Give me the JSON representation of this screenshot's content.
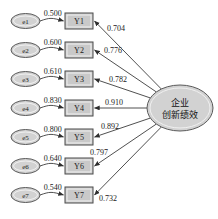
{
  "diagram": {
    "type": "sem-path-diagram",
    "title": "",
    "colors": {
      "node_fill": "#d2d2d2",
      "box_fill": "#c9c9c9",
      "node_stroke": "#5a5a5a",
      "line": "#3c3c3c",
      "text": "#1a1a1a",
      "background": "#ffffff"
    },
    "latent": {
      "id": "latent-construct",
      "line1": "企业",
      "line2": "创新绩效",
      "shape": "ellipse",
      "cx": 180,
      "cy": 108,
      "rx": 33,
      "ry": 23
    },
    "rows": [
      {
        "error_label": "e1",
        "error_coefficient": "0.500",
        "indicator_label": "Y1",
        "loading": "0.704",
        "cy": 21,
        "loading_label_x": 107,
        "loading_label_y": 31
      },
      {
        "error_label": "e2",
        "error_coefficient": "0.600",
        "indicator_label": "Y2",
        "loading": "0.776",
        "cy": 50,
        "loading_label_x": 104,
        "loading_label_y": 53
      },
      {
        "error_label": "e3",
        "error_coefficient": "0.610",
        "indicator_label": "Y3",
        "loading": "0.782",
        "cy": 79,
        "loading_label_x": 109,
        "loading_label_y": 82
      },
      {
        "error_label": "e4",
        "error_coefficient": "0.830",
        "indicator_label": "Y4",
        "loading": "0.910",
        "cy": 108,
        "loading_label_x": 105,
        "loading_label_y": 105
      },
      {
        "error_label": "e5",
        "error_coefficient": "0.800",
        "indicator_label": "Y5",
        "loading": "0.892",
        "cy": 137,
        "loading_label_x": 101,
        "loading_label_y": 129
      },
      {
        "error_label": "e6",
        "error_coefficient": "0.640",
        "indicator_label": "Y6",
        "loading": "0.797",
        "cy": 166,
        "loading_label_x": 90,
        "loading_label_y": 155
      },
      {
        "error_label": "e7",
        "error_coefficient": "0.540",
        "indicator_label": "Y7",
        "loading": "0.732",
        "cy": 195,
        "loading_label_x": 99,
        "loading_label_y": 201
      }
    ]
  }
}
